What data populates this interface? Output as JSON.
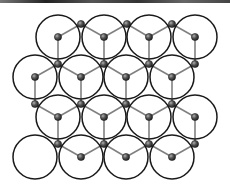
{
  "diagram": {
    "title": "",
    "type": "circle-packing-lattice",
    "circle_radius": 22,
    "atom_radius": 3.6,
    "colors": {
      "background": "#ffffff",
      "circle_stroke": "#1a1a1a",
      "bond": "#808080",
      "atom_dark": "#2a2a2a",
      "atom_light": "#9a9a9a",
      "top_strip": "#333333"
    },
    "circles": [
      {
        "x": 58,
        "y": 37,
        "center_atom": true
      },
      {
        "x": 104,
        "y": 37,
        "center_atom": true
      },
      {
        "x": 149,
        "y": 37,
        "center_atom": true
      },
      {
        "x": 195,
        "y": 37,
        "center_atom": true
      },
      {
        "x": 35,
        "y": 77,
        "center_atom": true
      },
      {
        "x": 81,
        "y": 77,
        "center_atom": true
      },
      {
        "x": 126,
        "y": 77,
        "center_atom": true
      },
      {
        "x": 172,
        "y": 77,
        "center_atom": true
      },
      {
        "x": 58,
        "y": 117,
        "center_atom": true
      },
      {
        "x": 104,
        "y": 117,
        "center_atom": true
      },
      {
        "x": 149,
        "y": 117,
        "center_atom": true
      },
      {
        "x": 195,
        "y": 117,
        "center_atom": true
      },
      {
        "x": 35,
        "y": 157,
        "center_atom": false
      },
      {
        "x": 81,
        "y": 157,
        "center_atom": true
      },
      {
        "x": 126,
        "y": 157,
        "center_atom": true
      },
      {
        "x": 172,
        "y": 157,
        "center_atom": true
      }
    ],
    "junction_atoms": [
      {
        "x": 81,
        "y": 24
      },
      {
        "x": 127,
        "y": 24
      },
      {
        "x": 172,
        "y": 24
      },
      {
        "x": 58,
        "y": 64
      },
      {
        "x": 104,
        "y": 64
      },
      {
        "x": 149,
        "y": 64
      },
      {
        "x": 195,
        "y": 64
      },
      {
        "x": 35,
        "y": 104
      },
      {
        "x": 81,
        "y": 104
      },
      {
        "x": 126,
        "y": 104
      },
      {
        "x": 172,
        "y": 104
      },
      {
        "x": 58,
        "y": 144
      },
      {
        "x": 104,
        "y": 144
      },
      {
        "x": 149,
        "y": 144
      },
      {
        "x": 195,
        "y": 144
      }
    ],
    "bonds": [
      [
        58,
        37,
        81,
        24
      ],
      [
        58,
        37,
        58,
        64
      ],
      [
        104,
        37,
        81,
        24
      ],
      [
        104,
        37,
        127,
        24
      ],
      [
        104,
        37,
        104,
        64
      ],
      [
        149,
        37,
        127,
        24
      ],
      [
        149,
        37,
        172,
        24
      ],
      [
        149,
        37,
        149,
        64
      ],
      [
        195,
        37,
        172,
        24
      ],
      [
        195,
        37,
        195,
        64
      ],
      [
        35,
        77,
        58,
        64
      ],
      [
        35,
        77,
        35,
        104
      ],
      [
        81,
        77,
        58,
        64
      ],
      [
        81,
        77,
        104,
        64
      ],
      [
        81,
        77,
        81,
        104
      ],
      [
        126,
        77,
        104,
        64
      ],
      [
        126,
        77,
        149,
        64
      ],
      [
        126,
        77,
        126,
        104
      ],
      [
        172,
        77,
        149,
        64
      ],
      [
        172,
        77,
        195,
        64
      ],
      [
        172,
        77,
        172,
        104
      ],
      [
        58,
        117,
        35,
        104
      ],
      [
        58,
        117,
        81,
        104
      ],
      [
        58,
        117,
        58,
        144
      ],
      [
        104,
        117,
        81,
        104
      ],
      [
        104,
        117,
        126,
        104
      ],
      [
        104,
        117,
        104,
        144
      ],
      [
        149,
        117,
        126,
        104
      ],
      [
        149,
        117,
        172,
        104
      ],
      [
        149,
        117,
        149,
        144
      ],
      [
        195,
        117,
        172,
        104
      ],
      [
        195,
        117,
        195,
        144
      ],
      [
        81,
        157,
        58,
        144
      ],
      [
        81,
        157,
        104,
        144
      ],
      [
        126,
        157,
        104,
        144
      ],
      [
        126,
        157,
        149,
        144
      ],
      [
        172,
        157,
        149,
        144
      ],
      [
        172,
        157,
        195,
        144
      ]
    ]
  }
}
